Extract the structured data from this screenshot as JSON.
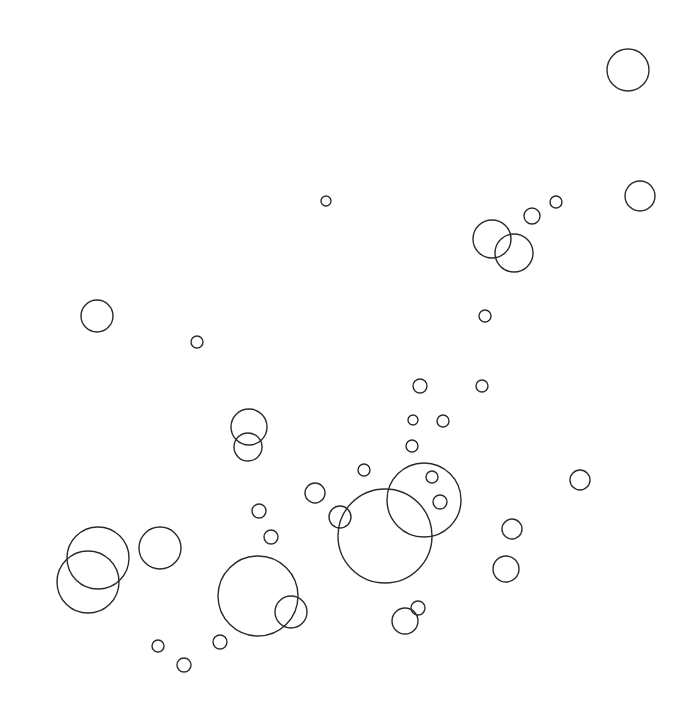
{
  "canvas": {
    "width": 693,
    "height": 720,
    "background": "#ffffff",
    "stroke": "#2b2b2b"
  },
  "circles": [
    {
      "cx": 628,
      "cy": 70,
      "r": 21
    },
    {
      "cx": 640,
      "cy": 196,
      "r": 15
    },
    {
      "cx": 326,
      "cy": 201,
      "r": 5
    },
    {
      "cx": 532,
      "cy": 216,
      "r": 8
    },
    {
      "cx": 556,
      "cy": 202,
      "r": 6
    },
    {
      "cx": 492,
      "cy": 239,
      "r": 19
    },
    {
      "cx": 514,
      "cy": 253,
      "r": 19
    },
    {
      "cx": 97,
      "cy": 316,
      "r": 16
    },
    {
      "cx": 197,
      "cy": 342,
      "r": 6
    },
    {
      "cx": 485,
      "cy": 316,
      "r": 6
    },
    {
      "cx": 420,
      "cy": 386,
      "r": 7
    },
    {
      "cx": 482,
      "cy": 386,
      "r": 6
    },
    {
      "cx": 413,
      "cy": 420,
      "r": 5
    },
    {
      "cx": 443,
      "cy": 421,
      "r": 6
    },
    {
      "cx": 412,
      "cy": 446,
      "r": 6
    },
    {
      "cx": 249,
      "cy": 427,
      "r": 18
    },
    {
      "cx": 248,
      "cy": 447,
      "r": 14
    },
    {
      "cx": 364,
      "cy": 470,
      "r": 6
    },
    {
      "cx": 432,
      "cy": 477,
      "r": 6
    },
    {
      "cx": 440,
      "cy": 502,
      "r": 7
    },
    {
      "cx": 580,
      "cy": 480,
      "r": 10
    },
    {
      "cx": 315,
      "cy": 493,
      "r": 10
    },
    {
      "cx": 340,
      "cy": 517,
      "r": 11
    },
    {
      "cx": 424,
      "cy": 500,
      "r": 37
    },
    {
      "cx": 385,
      "cy": 536,
      "r": 47
    },
    {
      "cx": 259,
      "cy": 511,
      "r": 7
    },
    {
      "cx": 271,
      "cy": 537,
      "r": 7
    },
    {
      "cx": 512,
      "cy": 529,
      "r": 10
    },
    {
      "cx": 506,
      "cy": 569,
      "r": 13
    },
    {
      "cx": 160,
      "cy": 548,
      "r": 21
    },
    {
      "cx": 98,
      "cy": 558,
      "r": 31
    },
    {
      "cx": 88,
      "cy": 582,
      "r": 31
    },
    {
      "cx": 258,
      "cy": 596,
      "r": 40
    },
    {
      "cx": 291,
      "cy": 612,
      "r": 16
    },
    {
      "cx": 405,
      "cy": 621,
      "r": 13
    },
    {
      "cx": 418,
      "cy": 608,
      "r": 7
    },
    {
      "cx": 220,
      "cy": 642,
      "r": 7
    },
    {
      "cx": 158,
      "cy": 646,
      "r": 6
    },
    {
      "cx": 184,
      "cy": 665,
      "r": 7
    }
  ]
}
